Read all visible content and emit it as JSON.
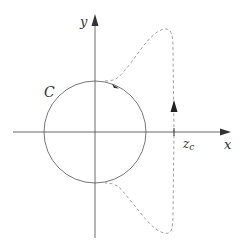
{
  "diagram": {
    "labels": {
      "y_axis": "y",
      "x_axis": "x",
      "contour": "C",
      "point_main": "z",
      "point_sub": "c"
    },
    "colors": {
      "axis": "#444444",
      "circle": "#555555",
      "dashed": "#888888",
      "text": "#333333"
    }
  }
}
